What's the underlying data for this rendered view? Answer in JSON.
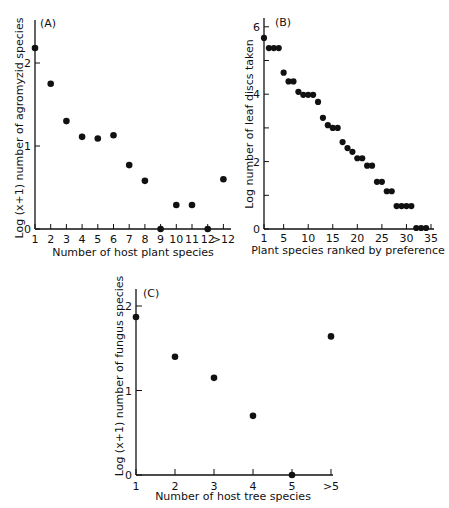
{
  "chart_data": [
    {
      "type": "scatter",
      "panel": "(A)",
      "title": "",
      "xlabel": "Number of host plant species",
      "ylabel": "Log (x+1) number of agromyzid species",
      "categories": [
        "1",
        "2",
        "3",
        "4",
        "5",
        "6",
        "7",
        "8",
        "9",
        "10",
        "11",
        "12",
        ">12"
      ],
      "values": [
        2.18,
        1.75,
        1.3,
        1.11,
        1.09,
        1.13,
        0.77,
        0.58,
        0.0,
        0.29,
        0.29,
        0.0,
        0.6
      ],
      "yticks": [
        "0",
        "1",
        "2"
      ],
      "ylim": [
        0,
        2.5
      ],
      "grid": false
    },
    {
      "type": "scatter",
      "panel": "(B)",
      "title": "",
      "xlabel": "Plant species ranked by preference",
      "ylabel": "Log number of leaf discs taken",
      "x": [
        1,
        2,
        3,
        4,
        5,
        6,
        7,
        8,
        9,
        10,
        11,
        12,
        13,
        14,
        15,
        16,
        17,
        18,
        19,
        20,
        21,
        22,
        23,
        24,
        25,
        26,
        27,
        28,
        29,
        30,
        31,
        32,
        33,
        34
      ],
      "values": [
        5.67,
        5.37,
        5.37,
        5.37,
        4.64,
        4.38,
        4.38,
        4.07,
        3.98,
        3.98,
        3.98,
        3.77,
        3.3,
        3.08,
        3.0,
        3.0,
        2.58,
        2.4,
        2.29,
        2.1,
        2.1,
        1.88,
        1.88,
        1.4,
        1.4,
        1.12,
        1.12,
        0.68,
        0.68,
        0.68,
        0.68,
        0.03,
        0.03,
        0.03
      ],
      "xticks": [
        "1",
        "5",
        "10",
        "15",
        "20",
        "25",
        "30",
        "35"
      ],
      "yticks": [
        "0",
        "2",
        "4",
        "6"
      ],
      "xlim": [
        1,
        35
      ],
      "ylim": [
        0,
        6
      ],
      "grid": false
    },
    {
      "type": "scatter",
      "panel": "(C)",
      "title": "",
      "xlabel": "Number of host tree species",
      "ylabel": "Log (x+1) number of fungus species",
      "categories": [
        "1",
        "2",
        "3",
        "4",
        "5",
        ">5"
      ],
      "values": [
        1.87,
        1.4,
        1.15,
        0.7,
        0.0,
        1.64
      ],
      "yticks": [
        "0",
        "1",
        "2"
      ],
      "ylim": [
        0,
        2.2
      ],
      "grid": false
    }
  ]
}
